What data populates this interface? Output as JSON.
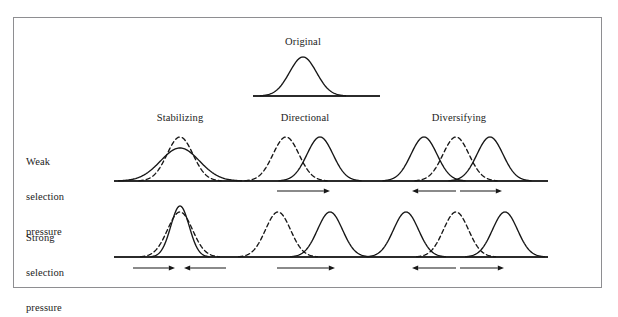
{
  "figure": {
    "title_top": "Original",
    "row_labels": [
      {
        "id": "weak",
        "line1": "Weak",
        "line2": "selection",
        "line3": "pressure"
      },
      {
        "id": "strong",
        "line1": "Strong",
        "line2": "selection",
        "line3": "pressure"
      }
    ],
    "column_headers": [
      {
        "id": "stabilizing",
        "label": "Stabilizing"
      },
      {
        "id": "directional",
        "label": "Directional"
      },
      {
        "id": "diversifying",
        "label": "Diversifying"
      }
    ],
    "colors": {
      "stroke": "#171717",
      "baseline": "#2b2b2b",
      "frame": "#8e8e91",
      "background": "#ffffff"
    },
    "legend_semantics": {
      "dashed": "original population distribution",
      "solid": "distribution after selection"
    }
  },
  "chart_data": {
    "type": "line",
    "title": "Original",
    "xlabel": "",
    "ylabel": "",
    "grid": false,
    "legend_position": "none",
    "panels": [
      {
        "id": "original",
        "row": "original",
        "column": "original",
        "baseline": {
          "x_start": 253,
          "x_end": 380,
          "y": 96
        },
        "curves": [
          {
            "style": "solid",
            "role": "original",
            "center": 303,
            "sigma": 13.5,
            "height": 39
          }
        ],
        "arrows": []
      },
      {
        "id": "weak-stabilizing",
        "row": "weak",
        "column": "stabilizing",
        "baseline": {
          "x_start": 114,
          "x_end": 548,
          "y": 181
        },
        "curves": [
          {
            "style": "dashed",
            "role": "original",
            "center": 180,
            "sigma": 13.0,
            "height": 44
          },
          {
            "style": "solid",
            "role": "after-selection",
            "center": 180,
            "sigma": 19.5,
            "height": 33
          }
        ],
        "arrows": []
      },
      {
        "id": "weak-directional",
        "row": "weak",
        "column": "directional",
        "baseline": {
          "x_start": 114,
          "x_end": 548,
          "y": 181
        },
        "curves": [
          {
            "style": "dashed",
            "role": "original",
            "center": 286,
            "sigma": 13.0,
            "height": 44
          },
          {
            "style": "solid",
            "role": "after-selection",
            "center": 320,
            "sigma": 13.0,
            "height": 44
          }
        ],
        "arrows": [
          {
            "x_start": 277,
            "x_end": 330,
            "y": 191,
            "direction": "right"
          }
        ]
      },
      {
        "id": "weak-diversifying",
        "row": "weak",
        "column": "diversifying",
        "baseline": {
          "x_start": 114,
          "x_end": 548,
          "y": 181
        },
        "curves": [
          {
            "style": "dashed",
            "role": "original",
            "center": 456,
            "sigma": 13.0,
            "height": 44
          },
          {
            "style": "solid",
            "role": "after-selection",
            "center": 424,
            "sigma": 13.0,
            "height": 44
          },
          {
            "style": "solid",
            "role": "after-selection",
            "center": 490,
            "sigma": 13.0,
            "height": 44
          }
        ],
        "arrows": [
          {
            "x_start": 456,
            "x_end": 412,
            "y": 191,
            "direction": "left"
          },
          {
            "x_start": 460,
            "x_end": 502,
            "y": 191,
            "direction": "right"
          }
        ]
      },
      {
        "id": "strong-stabilizing",
        "row": "strong",
        "column": "stabilizing",
        "baseline": {
          "x_start": 114,
          "x_end": 548,
          "y": 257
        },
        "curves": [
          {
            "style": "dashed",
            "role": "original",
            "center": 180,
            "sigma": 12.5,
            "height": 45
          },
          {
            "style": "solid",
            "role": "after-selection",
            "center": 180,
            "sigma": 9.2,
            "height": 51
          }
        ],
        "arrows": [
          {
            "x_start": 133,
            "x_end": 175,
            "y": 268,
            "direction": "right"
          },
          {
            "x_start": 226,
            "x_end": 184,
            "y": 268,
            "direction": "left"
          }
        ]
      },
      {
        "id": "strong-directional",
        "row": "strong",
        "column": "directional",
        "baseline": {
          "x_start": 114,
          "x_end": 548,
          "y": 257
        },
        "curves": [
          {
            "style": "dashed",
            "role": "original",
            "center": 278,
            "sigma": 12.5,
            "height": 45
          },
          {
            "style": "solid",
            "role": "after-selection",
            "center": 330,
            "sigma": 12.5,
            "height": 45
          }
        ],
        "arrows": [
          {
            "x_start": 277,
            "x_end": 335,
            "y": 268,
            "direction": "right"
          }
        ]
      },
      {
        "id": "strong-diversifying",
        "row": "strong",
        "column": "diversifying",
        "baseline": {
          "x_start": 114,
          "x_end": 548,
          "y": 257
        },
        "curves": [
          {
            "style": "dashed",
            "role": "original",
            "center": 456,
            "sigma": 12.5,
            "height": 45
          },
          {
            "style": "solid",
            "role": "after-selection",
            "center": 406,
            "sigma": 12.5,
            "height": 45
          },
          {
            "style": "solid",
            "role": "after-selection",
            "center": 505,
            "sigma": 12.5,
            "height": 45
          }
        ],
        "arrows": [
          {
            "x_start": 456,
            "x_end": 412,
            "y": 268,
            "direction": "left"
          },
          {
            "x_start": 460,
            "x_end": 504,
            "y": 268,
            "direction": "right"
          }
        ]
      }
    ],
    "label_positions": {
      "original": {
        "x": 303,
        "y": 36
      },
      "stabilizing": {
        "x": 180,
        "y": 112
      },
      "directional": {
        "x": 305,
        "y": 112
      },
      "diversifying": {
        "x": 459,
        "y": 112
      },
      "weak": {
        "x": 26,
        "y": 133
      },
      "strong": {
        "x": 26,
        "y": 209
      }
    }
  }
}
